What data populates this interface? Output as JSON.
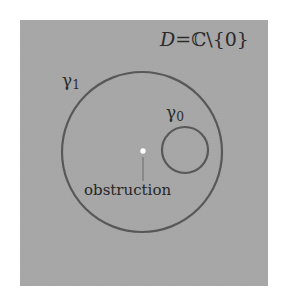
{
  "figure": {
    "type": "mathematical-diagram",
    "panel": {
      "background_color": "#a9a9a9",
      "x": 20,
      "y": 20,
      "width": 248,
      "height": 266
    },
    "stroke_color": "#585858",
    "text_color": "#2b2b2b",
    "puncture_color": "#ffffff"
  },
  "labels": {
    "domain": {
      "full_text": "D = ℂ\\{0}",
      "symbol": "D",
      "equals": "=",
      "set": "ℂ\\{0}"
    },
    "gamma_outer": {
      "base": "γ",
      "subscript": "1",
      "full_text": "γ1"
    },
    "gamma_inner": {
      "base": "γ",
      "subscript": "0",
      "full_text": "γ0"
    },
    "obstruction": "obstruction"
  },
  "shapes": {
    "outer_loop": {
      "name": "gamma-1-curve",
      "cx": 142,
      "cy": 152,
      "r": 80,
      "stroke_width": 2.2
    },
    "inner_loop": {
      "name": "gamma-0-curve",
      "cx": 185,
      "cy": 150,
      "r": 23,
      "stroke_width": 2.2
    },
    "puncture_point": {
      "name": "origin-puncture",
      "cx": 143,
      "cy": 151,
      "r": 2.6
    },
    "leader_line": {
      "name": "obstruction-leader",
      "x1": 143,
      "y1": 156,
      "x2": 143,
      "y2": 181,
      "stroke_width": 1
    }
  }
}
